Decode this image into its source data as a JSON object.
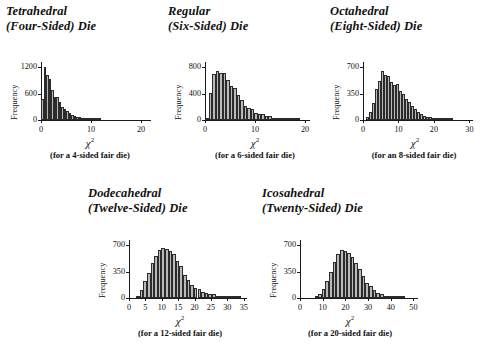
{
  "figure": {
    "axis_symbol": "χ",
    "axis_exponent": "2"
  },
  "panels": [
    {
      "id": "tetrahedral",
      "title_line1": "Tetrahedral",
      "title_line2": "(Four-Sided) Die",
      "ylabel": "Frequency",
      "caption": "(for a 4-sided fair die)",
      "yticks": [
        "1200",
        "600",
        "0"
      ],
      "xticks": [
        "0",
        "10",
        "20"
      ]
    },
    {
      "id": "regular",
      "title_line1": "Regular",
      "title_line2": "(Six-Sided) Die",
      "ylabel": "Frequency",
      "caption": "(for a 6-sided fair die)",
      "yticks": [
        "800",
        "400",
        "0"
      ],
      "xticks": [
        "0",
        "10",
        "20"
      ]
    },
    {
      "id": "octahedral",
      "title_line1": "Octahedral",
      "title_line2": "(Eight-Sided) Die",
      "ylabel": "Frequency",
      "caption": "(for an 8-sided fair die)",
      "yticks": [
        "700",
        "350",
        "0"
      ],
      "xticks": [
        "0",
        "10",
        "20",
        "30"
      ]
    },
    {
      "id": "dodecahedral",
      "title_line1": "Dodecahedral",
      "title_line2": "(Twelve-Sided) Die",
      "ylabel": "Frequency",
      "caption": "(for a 12-sided fair die)",
      "yticks": [
        "700",
        "350",
        "0"
      ],
      "xticks": [
        "0",
        "5",
        "10",
        "15",
        "20",
        "25",
        "30",
        "35"
      ]
    },
    {
      "id": "icosahedral",
      "title_line1": "Icosahedral",
      "title_line2": "(Twenty-Sided) Die",
      "ylabel": "Frequency",
      "caption": "(for a 20-sided fair die)",
      "yticks": [
        "700",
        "350",
        "0"
      ],
      "xticks": [
        "0",
        "10",
        "20",
        "30",
        "40",
        "50"
      ]
    }
  ],
  "chart_data": [
    {
      "type": "bar",
      "id": "tetrahedral",
      "title": "Tetrahedral (Four-Sided) Die",
      "xlabel": "chi^2",
      "ylabel": "Frequency",
      "subtitle": "(for a 4-sided fair die)",
      "grid": false,
      "legend": "none",
      "xlim": [
        0,
        22
      ],
      "ylim": [
        0,
        1320
      ],
      "yticks": [
        0,
        600,
        1200
      ],
      "xticks": [
        0,
        10,
        20
      ],
      "bin_width": 0.5,
      "bin_starts": [
        0.0,
        0.5,
        1.0,
        1.5,
        2.0,
        2.5,
        3.0,
        3.5,
        4.0,
        4.5,
        5.0,
        5.5,
        6.0,
        6.5,
        7.0,
        7.5,
        8.0,
        8.5,
        9.0,
        9.5,
        10.0,
        10.5,
        11.0,
        11.5
      ],
      "values": [
        470,
        1200,
        1020,
        940,
        690,
        530,
        530,
        400,
        300,
        250,
        195,
        150,
        120,
        90,
        75,
        62,
        48,
        40,
        30,
        22,
        16,
        10,
        6,
        3
      ]
    },
    {
      "type": "bar",
      "id": "regular",
      "title": "Regular (Six-Sided) Die",
      "xlabel": "chi^2",
      "ylabel": "Frequency",
      "subtitle": "(for a 6-sided fair die)",
      "grid": false,
      "legend": "none",
      "xlim": [
        0,
        21
      ],
      "ylim": [
        0,
        880
      ],
      "yticks": [
        0,
        400,
        800
      ],
      "xticks": [
        0,
        10,
        20
      ],
      "bin_width": 0.7,
      "bin_starts": [
        0.0,
        0.7,
        1.4,
        2.1,
        2.8,
        3.5,
        4.2,
        4.9,
        5.6,
        6.3,
        7.0,
        7.7,
        8.4,
        9.1,
        9.8,
        10.5,
        11.2,
        11.9,
        12.6,
        13.3,
        14.0,
        14.7,
        15.4,
        16.1,
        16.8,
        17.5,
        18.2
      ],
      "values": [
        20,
        415,
        700,
        740,
        720,
        720,
        600,
        520,
        490,
        380,
        300,
        215,
        175,
        170,
        100,
        95,
        95,
        60,
        55,
        30,
        28,
        20,
        18,
        12,
        12,
        5,
        4
      ]
    },
    {
      "type": "bar",
      "id": "octahedral",
      "title": "Octahedral (Eight-Sided) Die",
      "xlabel": "chi^2",
      "ylabel": "Frequency",
      "subtitle": "(for an 8-sided fair die)",
      "grid": false,
      "legend": "none",
      "xlim": [
        0,
        31
      ],
      "ylim": [
        0,
        770
      ],
      "yticks": [
        0,
        350,
        700
      ],
      "xticks": [
        0,
        10,
        20,
        30
      ],
      "bin_width": 0.85,
      "bin_starts": [
        0.85,
        1.7,
        2.55,
        3.4,
        4.25,
        5.1,
        5.95,
        6.8,
        7.65,
        8.5,
        9.35,
        10.2,
        11.05,
        11.9,
        12.75,
        13.6,
        14.45,
        15.3,
        16.15,
        17.0,
        17.85,
        18.7,
        19.55,
        20.4,
        21.25,
        22.1,
        22.95,
        23.8,
        24.65
      ],
      "values": [
        35,
        110,
        230,
        410,
        520,
        650,
        600,
        590,
        510,
        470,
        480,
        390,
        340,
        280,
        235,
        185,
        150,
        110,
        80,
        55,
        45,
        35,
        25,
        18,
        14,
        10,
        8,
        5,
        3
      ]
    },
    {
      "type": "bar",
      "id": "dodecahedral",
      "title": "Dodecahedral (Twelve-Sided) Die",
      "xlabel": "chi^2",
      "ylabel": "Frequency",
      "subtitle": "(for a 12-sided fair die)",
      "grid": false,
      "legend": "none",
      "xlim": [
        0,
        36
      ],
      "ylim": [
        0,
        770
      ],
      "yticks": [
        0,
        350,
        700
      ],
      "xticks": [
        0,
        5,
        10,
        15,
        20,
        25,
        30,
        35
      ],
      "bin_width": 1.1,
      "bin_starts": [
        2.2,
        3.3,
        4.4,
        5.5,
        6.6,
        7.7,
        8.8,
        9.9,
        11.0,
        12.1,
        13.2,
        14.3,
        15.4,
        16.5,
        17.6,
        18.7,
        19.8,
        20.9,
        22.0,
        23.1,
        24.2,
        25.3,
        26.4,
        27.5,
        28.6,
        29.7,
        30.8,
        31.9,
        33.0
      ],
      "values": [
        20,
        110,
        230,
        330,
        460,
        560,
        640,
        670,
        650,
        620,
        580,
        490,
        420,
        300,
        240,
        175,
        130,
        120,
        80,
        60,
        55,
        48,
        30,
        22,
        18,
        14,
        10,
        7,
        4
      ]
    },
    {
      "type": "bar",
      "id": "icosahedral",
      "title": "Icosahedral (Twenty-Sided) Die",
      "xlabel": "chi^2",
      "ylabel": "Frequency",
      "subtitle": "(for a 20-sided fair die)",
      "grid": false,
      "legend": "none",
      "xlim": [
        0,
        52
      ],
      "ylim": [
        0,
        770
      ],
      "yticks": [
        0,
        350,
        700
      ],
      "xticks": [
        0,
        10,
        20,
        30,
        40,
        50
      ],
      "bin_width": 1.6,
      "bin_starts": [
        6.4,
        8.0,
        9.6,
        11.2,
        12.8,
        14.4,
        16.0,
        17.6,
        19.2,
        20.8,
        22.4,
        24.0,
        25.6,
        27.2,
        28.8,
        30.4,
        32.0,
        33.6,
        35.2,
        36.8,
        38.4,
        40.0,
        41.6,
        43.2,
        44.8
      ],
      "values": [
        25,
        55,
        120,
        230,
        350,
        480,
        590,
        640,
        630,
        600,
        540,
        470,
        380,
        290,
        200,
        160,
        105,
        65,
        48,
        30,
        22,
        16,
        11,
        7,
        4
      ]
    }
  ]
}
